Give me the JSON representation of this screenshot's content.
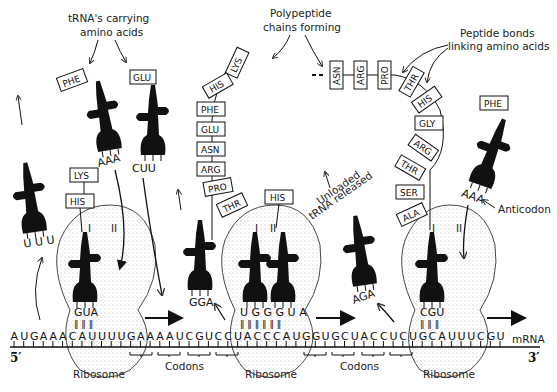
{
  "labels": {
    "trna_carrying": [
      "tRNA's carrying",
      "amino acids"
    ],
    "polypeptide": [
      "Polypeptide",
      "chains forming"
    ],
    "peptide_bonds": [
      "Peptide bonds",
      "linking amino acids"
    ],
    "unloaded": [
      "Unloaded",
      "tRNA released"
    ],
    "anticodon": "Anticodon",
    "ribosome": "Ribosome",
    "codons": "Codons",
    "mrna": "mRNA",
    "five_prime": "5′",
    "three_prime": "3′",
    "site_one": "I",
    "site_two": "II"
  },
  "mrna_sequence": "AUGAAACAUUUUGAAAAUCGUCCUACCCAUGGUGCUACCUCUGCAUUUCGU",
  "free_trnas": [
    {
      "amino_acid": "",
      "anticodon": "UUU",
      "state": "released"
    },
    {
      "amino_acid": "PHE",
      "anticodon": "AAA",
      "state": "incoming"
    },
    {
      "amino_acid": "GLU",
      "anticodon": "CUU",
      "state": "incoming"
    },
    {
      "amino_acid": "",
      "anticodon": "GGA",
      "state": "released"
    },
    {
      "amino_acid": "",
      "anticodon": "AGA",
      "state": "released"
    },
    {
      "amino_acid": "PHE",
      "anticodon": "AAA",
      "state": "incoming"
    }
  ],
  "ribosomes": [
    {
      "chain": [
        "LYS",
        "HIS"
      ],
      "bound_anticodons": [
        "GUA"
      ]
    },
    {
      "chain": [
        "LYS",
        "HIS",
        "PHE",
        "GLU",
        "ASN",
        "ARG",
        "PRO",
        "THR"
      ],
      "incoming": "HIS",
      "bound_anticodons": [
        "UGG",
        "GUA"
      ]
    },
    {
      "chain": [
        "ASN",
        "ARG",
        "PRO",
        "THR",
        "HIS",
        "GLY",
        "ARG",
        "THR",
        "SER",
        "ALA"
      ],
      "bound_anticodons": [
        "CGU"
      ]
    }
  ]
}
